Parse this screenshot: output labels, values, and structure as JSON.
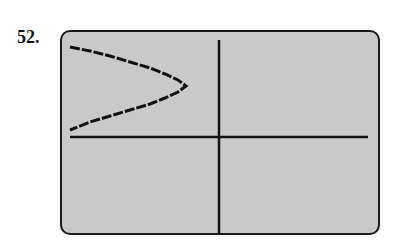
{
  "problem": {
    "number": "52."
  },
  "chart_data": {
    "type": "line",
    "title": "",
    "xlabel": "",
    "ylabel": "",
    "grid": false,
    "axes": {
      "x_axis_pixel_y": 137,
      "y_axis_pixel_x": 219
    },
    "series": [
      {
        "name": "parabola",
        "points_px": [
          [
            70,
            47
          ],
          [
            90,
            51
          ],
          [
            110,
            56
          ],
          [
            130,
            62
          ],
          [
            150,
            68
          ],
          [
            165,
            74
          ],
          [
            178,
            80
          ],
          [
            186,
            86
          ],
          [
            178,
            92
          ],
          [
            165,
            98
          ],
          [
            150,
            104
          ],
          [
            130,
            110
          ],
          [
            110,
            116
          ],
          [
            90,
            122
          ],
          [
            70,
            130
          ]
        ]
      }
    ],
    "colors": {
      "screen": "#c9c9c9",
      "ink": "#111111"
    }
  }
}
